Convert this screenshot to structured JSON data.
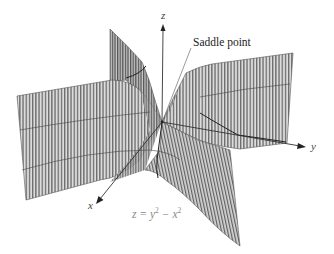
{
  "figure": {
    "formula": {
      "lhs": "z",
      "eq": "=",
      "term1": "y",
      "exp1": "2",
      "minus": "−",
      "term2": "x",
      "exp2": "2",
      "full_text": "z = y^2 − x^2"
    },
    "annotation": "Saddle point",
    "axes": {
      "x": "x",
      "y": "y",
      "z": "z"
    },
    "colors": {
      "surface_fill": "#d6d6d6",
      "surface_stripe": "#6e6e6e",
      "axis": "#333333",
      "formula_text": "#8a8a8a"
    }
  }
}
